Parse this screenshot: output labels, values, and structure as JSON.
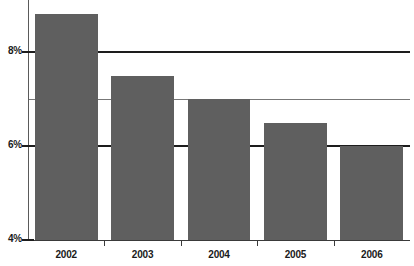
{
  "chart_data": {
    "type": "bar",
    "title": "",
    "subtitle": "",
    "xlabel": "",
    "ylabel": "",
    "categories": [
      "2002",
      "2003",
      "2004",
      "2005",
      "2006"
    ],
    "values": [
      8.8,
      7.5,
      7.0,
      6.5,
      6.0
    ],
    "value_suffix": "%",
    "ylim": [
      4,
      9.1
    ],
    "yticks": [
      {
        "value": 8,
        "label": "8%"
      },
      {
        "value": 6,
        "label": "6%"
      },
      {
        "value": 4,
        "label": "4%"
      }
    ],
    "gridlines": [
      {
        "value": 8,
        "style": "major"
      },
      {
        "value": 7,
        "style": "minor"
      },
      {
        "value": 6,
        "style": "major"
      }
    ],
    "grid": true,
    "legend": "none",
    "colors": {
      "bar": "#5f5f5f",
      "gridline": "#1d1d1d",
      "minor_gridline": "#4a4a4a",
      "axis": "#3a3a3a",
      "text": "#1a1a1a",
      "background": "#ffffff"
    }
  }
}
